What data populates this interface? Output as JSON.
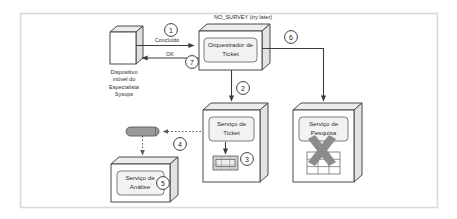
{
  "frame": {
    "name": "diagram-frame",
    "border_color": "#d8d8d8",
    "background": "#ffffff"
  },
  "palette": {
    "stroke": "#4a4a4a",
    "node_fill": "#ffffff",
    "node_side_fill": "#ececec",
    "inner_fill": "#f2f2f2",
    "accent_gray": "#8c8c8c",
    "text": "#2b2b2b",
    "arrow": "#3c3c3c"
  },
  "annotations": {
    "top_status": "NO_SURVEY (try later)"
  },
  "nodes": [
    {
      "id": "mobile-device",
      "type": "device-3d",
      "label": "",
      "caption": [
        "Dispositivo",
        "móvel do",
        "Especialista",
        "Sysops"
      ]
    },
    {
      "id": "ticket-orchestrator",
      "type": "container-3d",
      "label": [
        "Orquestrador de",
        "Ticket"
      ],
      "caption": []
    },
    {
      "id": "ticket-service",
      "type": "container-3d",
      "label": [
        "Serviço de",
        "Ticket"
      ],
      "caption": [],
      "icon": "database-table-icon"
    },
    {
      "id": "survey-service",
      "type": "container-3d",
      "label": [
        "Serviço de",
        "Pesquisa"
      ],
      "caption": [],
      "icon": "grid-table-icon",
      "overlay": "x-cross-icon"
    },
    {
      "id": "analysis-service",
      "type": "container-3d",
      "label": [
        "Serviço de",
        "Análise"
      ],
      "caption": []
    },
    {
      "id": "message-queue",
      "type": "pill",
      "label": "",
      "caption": []
    }
  ],
  "edges": [
    {
      "id": "edge-concluido",
      "label": "Concluído",
      "style": "solid",
      "from": "mobile-device",
      "to": "ticket-orchestrator"
    },
    {
      "id": "edge-ok",
      "label": "OK",
      "style": "solid",
      "from": "ticket-orchestrator",
      "to": "mobile-device"
    },
    {
      "id": "edge-orch-to-ticket",
      "label": "",
      "style": "solid",
      "from": "ticket-orchestrator",
      "to": "ticket-service"
    },
    {
      "id": "edge-orch-to-survey",
      "label": "",
      "style": "solid",
      "from": "ticket-orchestrator",
      "to": "survey-service"
    },
    {
      "id": "edge-ticket-to-queue",
      "label": "",
      "style": "dotted",
      "from": "ticket-service",
      "to": "message-queue"
    },
    {
      "id": "edge-queue-to-analysis",
      "label": "",
      "style": "dotted",
      "from": "message-queue",
      "to": "analysis-service"
    },
    {
      "id": "edge-ticket-to-db",
      "label": "",
      "style": "solid",
      "from": "ticket-service",
      "to": "database-table-icon"
    }
  ],
  "badges": [
    {
      "id": "badge-1",
      "number": "1"
    },
    {
      "id": "badge-2",
      "number": "2"
    },
    {
      "id": "badge-3",
      "number": "3"
    },
    {
      "id": "badge-4",
      "number": "4"
    },
    {
      "id": "badge-5",
      "number": "5"
    },
    {
      "id": "badge-6",
      "number": "6"
    },
    {
      "id": "badge-7",
      "number": "7"
    }
  ]
}
